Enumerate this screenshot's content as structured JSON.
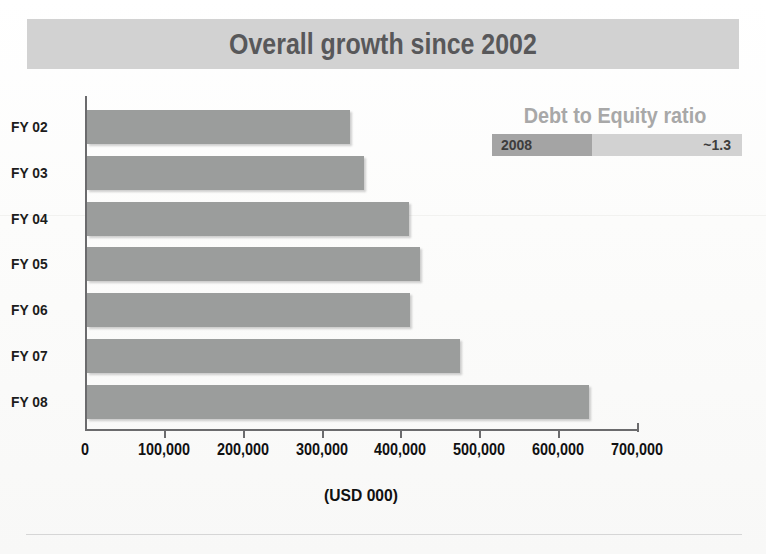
{
  "title": "Overall growth since 2002",
  "legend": {
    "heading": "Debt to Equity ratio",
    "year_label": "2008",
    "value_label": "~1.3"
  },
  "colors": {
    "title_band": "#d2d2d2",
    "title_text": "#58585a",
    "bar": "#9b9d9c",
    "legend_heading": "#a8a8a8",
    "legend_year_cell": "#a4a4a4",
    "legend_value_cell": "#d2d2d2",
    "axis": "#6b6b6d"
  },
  "chart_data": {
    "type": "bar",
    "orientation": "horizontal",
    "title": "Overall growth since 2002",
    "xlabel": "(USD 000)",
    "ylabel": "",
    "xlim": [
      0,
      700000
    ],
    "grid": false,
    "legend_position": "top-right",
    "xticks": [
      0,
      100000,
      200000,
      300000,
      400000,
      500000,
      600000,
      700000
    ],
    "xtick_labels": [
      "0",
      "100,000",
      "200,000",
      "300,000",
      "400,000",
      "500,000",
      "600,000",
      "700,000"
    ],
    "categories": [
      "FY 02",
      "FY 03",
      "FY 04",
      "FY 05",
      "FY 06",
      "FY 07",
      "FY 08"
    ],
    "values": [
      333000,
      351000,
      408000,
      422000,
      409000,
      473000,
      637000
    ],
    "series": [
      {
        "name": "Overall growth",
        "values": [
          333000,
          351000,
          408000,
          422000,
          409000,
          473000,
          637000
        ]
      }
    ],
    "annotations": [
      {
        "text": "Debt to Equity ratio",
        "rows": [
          {
            "label": "2008",
            "value": "~1.3"
          }
        ]
      }
    ]
  }
}
